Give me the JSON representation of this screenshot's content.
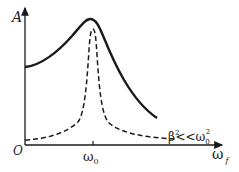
{
  "diagram": {
    "y_axis_label": "A",
    "x_axis_label": "ω",
    "x_axis_subscript": "f",
    "origin_label": "O",
    "peak_tick_label": "ω",
    "peak_tick_subscript": "0",
    "condition_label": {
      "beta": "β",
      "beta_sup": "2",
      "relation": "<<",
      "omega": "ω",
      "omega_sub": "0",
      "omega_sup": "2"
    },
    "curves": [
      {
        "name": "large-damping",
        "style": "solid"
      },
      {
        "name": "small-damping",
        "style": "dashed",
        "condition": "β² << ω0²"
      }
    ],
    "colors": {
      "line": "#1a1a1a",
      "background": "#ffffff"
    }
  }
}
